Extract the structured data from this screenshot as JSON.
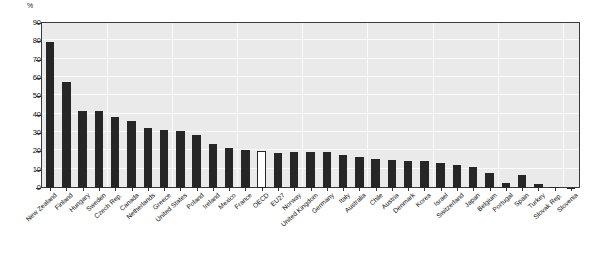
{
  "chart_data": {
    "type": "bar",
    "title": "",
    "xlabel": "",
    "ylabel": "%",
    "ylim": [
      0,
      90
    ],
    "yticks": [
      0,
      10,
      20,
      30,
      40,
      50,
      60,
      70,
      80,
      90
    ],
    "grid": true,
    "legend": "none",
    "highlight_category": "OECD",
    "highlight_style": "hollow-white-bar",
    "bar_color": "#262626",
    "highlight_bar_color": "#ffffff",
    "plot_background": "#eaeaea",
    "categories": [
      "New Zealand",
      "Finland",
      "Hungary",
      "Sweden",
      "Czech Rep.",
      "Canada",
      "Netherlands",
      "Greece",
      "United States",
      "Poland",
      "Ireland",
      "Mexico",
      "France",
      "OECD",
      "EU27",
      "Norway",
      "United Kingdom",
      "Germany",
      "Italy",
      "Australia",
      "Chile",
      "Austria",
      "Denmark",
      "Korea",
      "Israel",
      "Switzerland",
      "Japan",
      "Belgium",
      "Portugal",
      "Spain",
      "Turkey",
      "Slovak Rep.",
      "Slovenia"
    ],
    "values": [
      79.5,
      58.0,
      42.0,
      42.2,
      39.0,
      36.5,
      32.5,
      31.8,
      31.0,
      29.0,
      24.0,
      22.0,
      20.5,
      20.0,
      19.0,
      19.5,
      19.5,
      19.5,
      18.0,
      17.0,
      16.0,
      15.5,
      15.0,
      14.5,
      13.5,
      12.5,
      11.5,
      8.0,
      3.0,
      7.0,
      2.0,
      0.6,
      0.2
    ]
  }
}
